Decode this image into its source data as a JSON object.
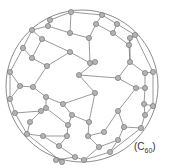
{
  "label": {
    "open": "(C",
    "subscript": "60",
    "close": ")"
  },
  "colors": {
    "background": "#ffffff",
    "bond": "#6e6e6e",
    "outline": "#6e6e6e",
    "atom_fill": "#b4b4b4",
    "atom_stroke": "#6a6a6a"
  },
  "outline_circle": {
    "cx": 82,
    "cy": 86,
    "r": 76
  },
  "atom_radius": 2.6,
  "atoms": [
    [
      71,
      12
    ],
    [
      102,
      15
    ],
    [
      50,
      20
    ],
    [
      96,
      24
    ],
    [
      117,
      24
    ],
    [
      48,
      26
    ],
    [
      32,
      30
    ],
    [
      113,
      33
    ],
    [
      135,
      35
    ],
    [
      42,
      39
    ],
    [
      130,
      38
    ],
    [
      70,
      33
    ],
    [
      89,
      38
    ],
    [
      23,
      48
    ],
    [
      129,
      45
    ],
    [
      70,
      52
    ],
    [
      32,
      58
    ],
    [
      90,
      63
    ],
    [
      95,
      62
    ],
    [
      130,
      62
    ],
    [
      47,
      66
    ],
    [
      10,
      72
    ],
    [
      153,
      72
    ],
    [
      145,
      73
    ],
    [
      79,
      75
    ],
    [
      118,
      78
    ],
    [
      20,
      86
    ],
    [
      33,
      87
    ],
    [
      136,
      88
    ],
    [
      145,
      88
    ],
    [
      95,
      93
    ],
    [
      46,
      97
    ],
    [
      10,
      99
    ],
    [
      46,
      108
    ],
    [
      63,
      104
    ],
    [
      144,
      104
    ],
    [
      153,
      106
    ],
    [
      41,
      111
    ],
    [
      72,
      115
    ],
    [
      118,
      111
    ],
    [
      145,
      115
    ],
    [
      15,
      113
    ],
    [
      89,
      122
    ],
    [
      124,
      127
    ],
    [
      141,
      128
    ],
    [
      68,
      125
    ],
    [
      27,
      134
    ],
    [
      43,
      136
    ],
    [
      88,
      136
    ],
    [
      118,
      140
    ],
    [
      67,
      136
    ],
    [
      59,
      146
    ],
    [
      99,
      147
    ],
    [
      110,
      152
    ],
    [
      75,
      157
    ],
    [
      62,
      162
    ],
    [
      84,
      160
    ],
    [
      56,
      160
    ],
    [
      104,
      132
    ],
    [
      30,
      122
    ]
  ],
  "bonds": [
    [
      0,
      1
    ],
    [
      0,
      2
    ],
    [
      0,
      11
    ],
    [
      1,
      3
    ],
    [
      1,
      4
    ],
    [
      3,
      12
    ],
    [
      3,
      7
    ],
    [
      4,
      7
    ],
    [
      4,
      8
    ],
    [
      2,
      5
    ],
    [
      5,
      6
    ],
    [
      5,
      11
    ],
    [
      6,
      9
    ],
    [
      6,
      13
    ],
    [
      9,
      15
    ],
    [
      9,
      16
    ],
    [
      11,
      12
    ],
    [
      7,
      14
    ],
    [
      8,
      10
    ],
    [
      8,
      22
    ],
    [
      10,
      14
    ],
    [
      10,
      19
    ],
    [
      12,
      17
    ],
    [
      15,
      17
    ],
    [
      15,
      20
    ],
    [
      16,
      13
    ],
    [
      16,
      20
    ],
    [
      13,
      21
    ],
    [
      17,
      18
    ],
    [
      18,
      24
    ],
    [
      14,
      19
    ],
    [
      19,
      23
    ],
    [
      19,
      25
    ],
    [
      22,
      23
    ],
    [
      22,
      36
    ],
    [
      23,
      29
    ],
    [
      24,
      25
    ],
    [
      24,
      30
    ],
    [
      20,
      27
    ],
    [
      21,
      26
    ],
    [
      21,
      32
    ],
    [
      26,
      27
    ],
    [
      26,
      32
    ],
    [
      27,
      31
    ],
    [
      25,
      28
    ],
    [
      28,
      29
    ],
    [
      28,
      39
    ],
    [
      29,
      35
    ],
    [
      30,
      34
    ],
    [
      30,
      42
    ],
    [
      31,
      33
    ],
    [
      31,
      34
    ],
    [
      32,
      41
    ],
    [
      33,
      37
    ],
    [
      33,
      45
    ],
    [
      34,
      38
    ],
    [
      35,
      36
    ],
    [
      35,
      40
    ],
    [
      36,
      40
    ],
    [
      37,
      41
    ],
    [
      37,
      59
    ],
    [
      38,
      42
    ],
    [
      38,
      45
    ],
    [
      39,
      43
    ],
    [
      39,
      58
    ],
    [
      40,
      44
    ],
    [
      41,
      46
    ],
    [
      42,
      48
    ],
    [
      43,
      44
    ],
    [
      43,
      49
    ],
    [
      44,
      53
    ],
    [
      45,
      50
    ],
    [
      46,
      47
    ],
    [
      46,
      55
    ],
    [
      47,
      50
    ],
    [
      47,
      51
    ],
    [
      48,
      52
    ],
    [
      48,
      58
    ],
    [
      49,
      52
    ],
    [
      49,
      53
    ],
    [
      50,
      51
    ],
    [
      51,
      54
    ],
    [
      52,
      56
    ],
    [
      53,
      56
    ],
    [
      54,
      56
    ],
    [
      54,
      57
    ],
    [
      55,
      57
    ],
    [
      59,
      46
    ]
  ]
}
